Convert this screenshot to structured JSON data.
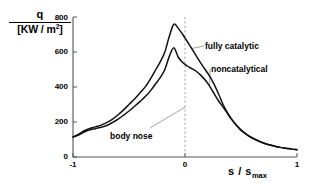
{
  "chart_data": {
    "type": "line",
    "title": "",
    "xlabel": "s / s_max",
    "ylabel": "q / [KW / m^2]",
    "xlim": [
      -1,
      1
    ],
    "ylim": [
      0,
      800
    ],
    "grid": false,
    "legend_position": "inline-annotations",
    "xticks": [
      -1,
      0,
      1
    ],
    "xtick_labels": [
      "-1",
      "0",
      "1"
    ],
    "yticks": [
      0,
      200,
      400,
      600,
      800
    ],
    "ytick_labels": [
      "0",
      "200",
      "400",
      "600",
      "800"
    ],
    "series": [
      {
        "name": "fully catalytic",
        "x": [
          -1.0,
          -0.95,
          -0.9,
          -0.85,
          -0.8,
          -0.75,
          -0.7,
          -0.65,
          -0.6,
          -0.55,
          -0.5,
          -0.45,
          -0.4,
          -0.35,
          -0.3,
          -0.26,
          -0.22,
          -0.18,
          -0.14,
          -0.1,
          -0.06,
          -0.02,
          0.02,
          0.06,
          0.1,
          0.14,
          0.18,
          0.22,
          0.26,
          0.3,
          0.34,
          0.38,
          0.42,
          0.46,
          0.5,
          0.55,
          0.6,
          0.65,
          0.7,
          0.75,
          0.8,
          0.85,
          0.9,
          0.95,
          1.0
        ],
        "values": [
          115,
          130,
          150,
          163,
          172,
          182,
          196,
          215,
          240,
          268,
          300,
          332,
          368,
          405,
          455,
          500,
          545,
          600,
          690,
          758,
          735,
          700,
          660,
          620,
          578,
          538,
          500,
          462,
          415,
          360,
          300,
          252,
          212,
          180,
          152,
          128,
          108,
          92,
          80,
          70,
          62,
          55,
          50,
          45,
          42
        ]
      },
      {
        "name": "noncatalytical",
        "x": [
          -1.0,
          -0.95,
          -0.9,
          -0.85,
          -0.8,
          -0.75,
          -0.7,
          -0.65,
          -0.6,
          -0.55,
          -0.5,
          -0.45,
          -0.4,
          -0.35,
          -0.3,
          -0.26,
          -0.22,
          -0.18,
          -0.14,
          -0.1,
          -0.06,
          -0.02,
          0.02,
          0.06,
          0.1,
          0.14,
          0.18,
          0.22,
          0.26,
          0.3,
          0.34,
          0.38,
          0.42,
          0.46,
          0.5,
          0.55,
          0.6,
          0.65,
          0.7,
          0.75,
          0.8,
          0.85,
          0.9,
          0.95,
          1.0
        ],
        "values": [
          113,
          126,
          143,
          155,
          162,
          170,
          180,
          196,
          215,
          238,
          263,
          290,
          318,
          348,
          385,
          420,
          455,
          500,
          575,
          625,
          570,
          540,
          520,
          505,
          490,
          468,
          440,
          405,
          362,
          320,
          285,
          248,
          212,
          182,
          156,
          130,
          110,
          94,
          80,
          70,
          62,
          55,
          50,
          45,
          42
        ]
      }
    ],
    "annotations": [
      {
        "text": "fully catalytic",
        "note": "leader line to upper curve right flank"
      },
      {
        "text": "noncatalytical",
        "note": "leader line to lower curve right flank"
      },
      {
        "text": "body nose",
        "note": "leader line to dashed vertical at s/s_max = 0"
      }
    ],
    "reference_lines": [
      {
        "orientation": "vertical",
        "value": 0,
        "style": "dashed",
        "color": "#9a9a9a"
      }
    ]
  },
  "axes": {
    "y_title_numerator": "q",
    "y_title_denominator_open": "[KW / m",
    "y_title_denominator_exp": "2",
    "y_title_denominator_close": "]",
    "x_title_main": "s / s",
    "x_title_sub": "max"
  },
  "labels": {
    "fully_catalytic": "fully catalytic",
    "noncatalytical": "noncatalytical",
    "body_nose": "body nose"
  },
  "colors": {
    "curve": "#111111",
    "axis": "#555555",
    "dashed_reference": "#9a9a9a",
    "leader_line": "#8d8d8d",
    "background": "#ffffff"
  }
}
